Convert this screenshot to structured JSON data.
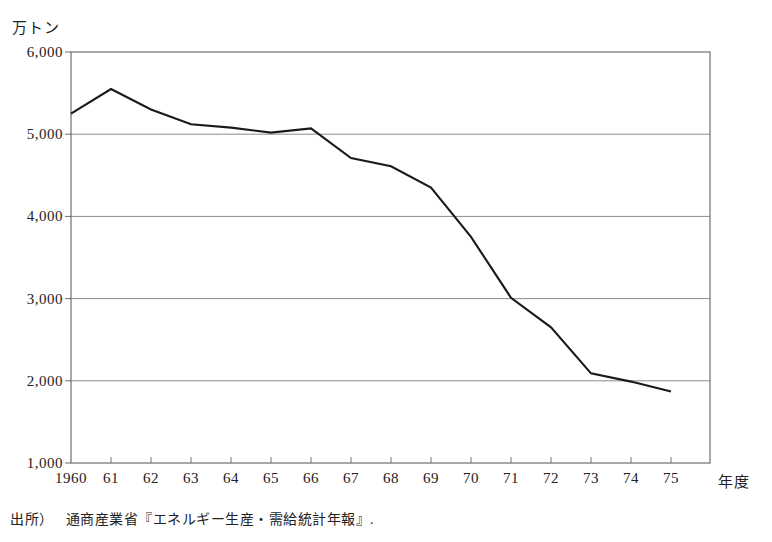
{
  "figure": {
    "unit_label": "万トン",
    "x_axis_title": "年度",
    "source_prefix": "出所）",
    "source_text": "通商産業省『エネルギー生産・需給統計年報』.",
    "line_color": "#1a1a1a",
    "grid_color": "#8c8c8c",
    "axis_color": "#6e6e6e"
  },
  "chart_data": {
    "type": "line",
    "title": "",
    "xlabel": "年度",
    "ylabel": "万トン",
    "categories": [
      "1960",
      "61",
      "62",
      "63",
      "64",
      "65",
      "66",
      "67",
      "68",
      "69",
      "70",
      "71",
      "72",
      "73",
      "74",
      "75"
    ],
    "x": [
      1960,
      1961,
      1962,
      1963,
      1964,
      1965,
      1966,
      1967,
      1968,
      1969,
      1970,
      1971,
      1972,
      1973,
      1974,
      1975
    ],
    "values": [
      5250,
      5550,
      5300,
      5120,
      5080,
      5020,
      5070,
      4710,
      4610,
      4350,
      3750,
      3010,
      2650,
      2090,
      1990,
      1870
    ],
    "ylim": [
      1000,
      6000
    ],
    "ytick_values": [
      6000,
      5000,
      4000,
      3000,
      2000,
      1000
    ],
    "ytick_labels": [
      "6,000",
      "5,000",
      "4,000",
      "3,000",
      "2,000",
      "1,000"
    ],
    "grid": "horizontal",
    "legend": "none",
    "series": [
      {
        "name": "石炭生産量",
        "values": [
          5250,
          5550,
          5300,
          5120,
          5080,
          5020,
          5070,
          4710,
          4610,
          4350,
          3750,
          3010,
          2650,
          2090,
          1990,
          1870
        ]
      }
    ]
  }
}
